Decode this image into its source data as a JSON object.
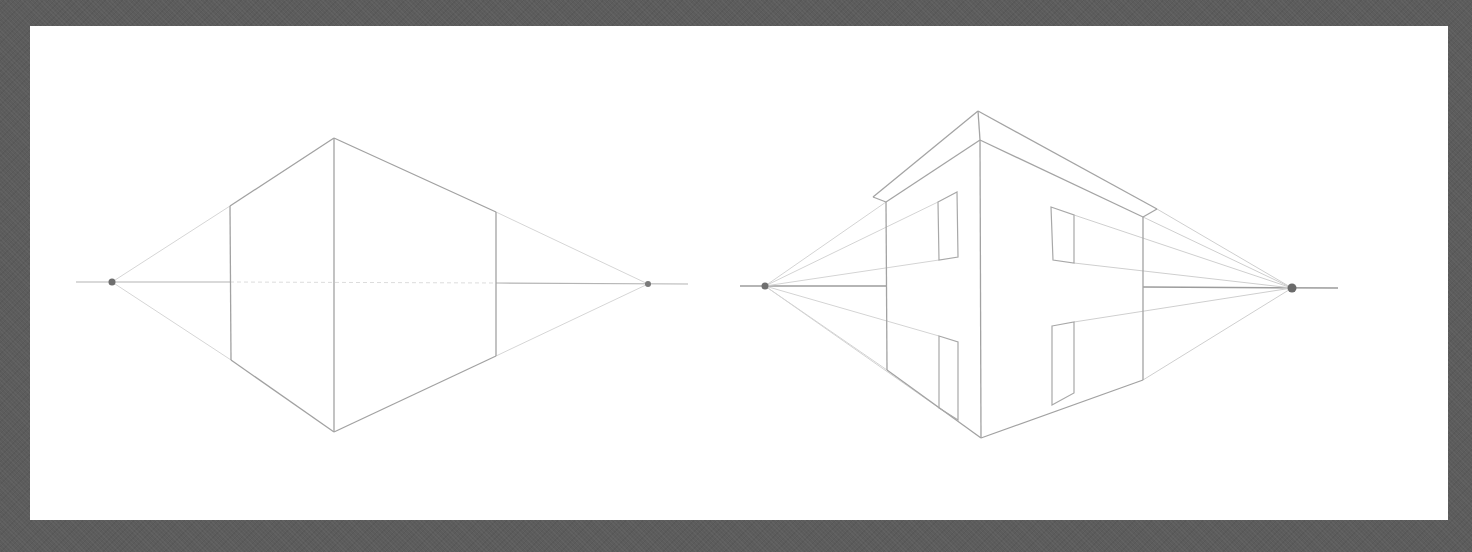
{
  "scene": {
    "description": "Pencil sketch of two-point perspective: a box and a house on paper",
    "background_color": "#5c5c5c",
    "paper_color": "#ffffff",
    "pencil_color": "#9a9a9a",
    "light_line_color": "#cfcfcf",
    "dot_color": "#6e6e6e"
  },
  "paper": {
    "x": 30,
    "y": 26,
    "width": 1418,
    "height": 494
  },
  "figures": [
    {
      "name": "perspective-box",
      "label": "Two-point perspective box",
      "horizon": {
        "x1": 76,
        "y1": 282,
        "x2": 688,
        "y2": 284
      },
      "vanishing_points": [
        {
          "x": 112,
          "y": 282
        },
        {
          "x": 648,
          "y": 284
        }
      ],
      "front_edge": {
        "x": 334,
        "top": 138,
        "bottom": 432
      },
      "left_edge": {
        "x": 230,
        "top": 206,
        "bottom": 360
      },
      "right_edge": {
        "x": 496,
        "top": 212,
        "bottom": 356
      }
    },
    {
      "name": "perspective-house",
      "label": "Two-point perspective house",
      "horizon": {
        "x1": 740,
        "y1": 286,
        "x2": 1338,
        "y2": 288
      },
      "vanishing_points": [
        {
          "x": 765,
          "y": 286
        },
        {
          "x": 1292,
          "y": 288
        }
      ],
      "front_edge": {
        "x": 980,
        "top": 140,
        "bottom": 438
      },
      "left_wall": {
        "x": 886,
        "top": 202,
        "bottom": 370
      },
      "right_wall": {
        "x": 1143,
        "top": 217,
        "bottom": 380
      },
      "roof": {
        "peak": {
          "x": 978,
          "y": 111
        },
        "left_eave": {
          "x": 873,
          "y": 197
        },
        "right_eave": {
          "x": 1157,
          "y": 209
        }
      },
      "windows": [
        {
          "side": "left",
          "points": [
            [
              938,
              202
            ],
            [
              957,
              192
            ],
            [
              958,
              257
            ],
            [
              939,
              260
            ]
          ]
        },
        {
          "side": "right",
          "points": [
            [
              1051,
              207
            ],
            [
              1074,
              215
            ],
            [
              1074,
              263
            ],
            [
              1053,
              260
            ]
          ]
        }
      ],
      "doors": [
        {
          "side": "left",
          "points": [
            [
              939,
              336
            ],
            [
              958,
              342
            ],
            [
              958,
              420
            ],
            [
              939,
              408
            ]
          ]
        },
        {
          "side": "right",
          "points": [
            [
              1052,
              326
            ],
            [
              1074,
              322
            ],
            [
              1074,
              393
            ],
            [
              1052,
              405
            ]
          ]
        }
      ]
    }
  ]
}
